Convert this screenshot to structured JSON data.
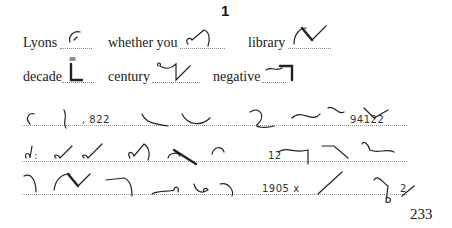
{
  "page": {
    "exercise_number": "1",
    "page_number": "233"
  },
  "vocabulary": [
    {
      "word": "Lyons"
    },
    {
      "word": "whether you"
    },
    {
      "word": "library"
    },
    {
      "word": "decade"
    },
    {
      "word": "century"
    },
    {
      "word": "negative"
    }
  ],
  "passage": {
    "line1_numbers": [
      ", 822",
      "94122"
    ],
    "line2_numbers": [
      ":",
      "12"
    ],
    "line3_numbers": [
      "1905 x",
      "2"
    ]
  }
}
